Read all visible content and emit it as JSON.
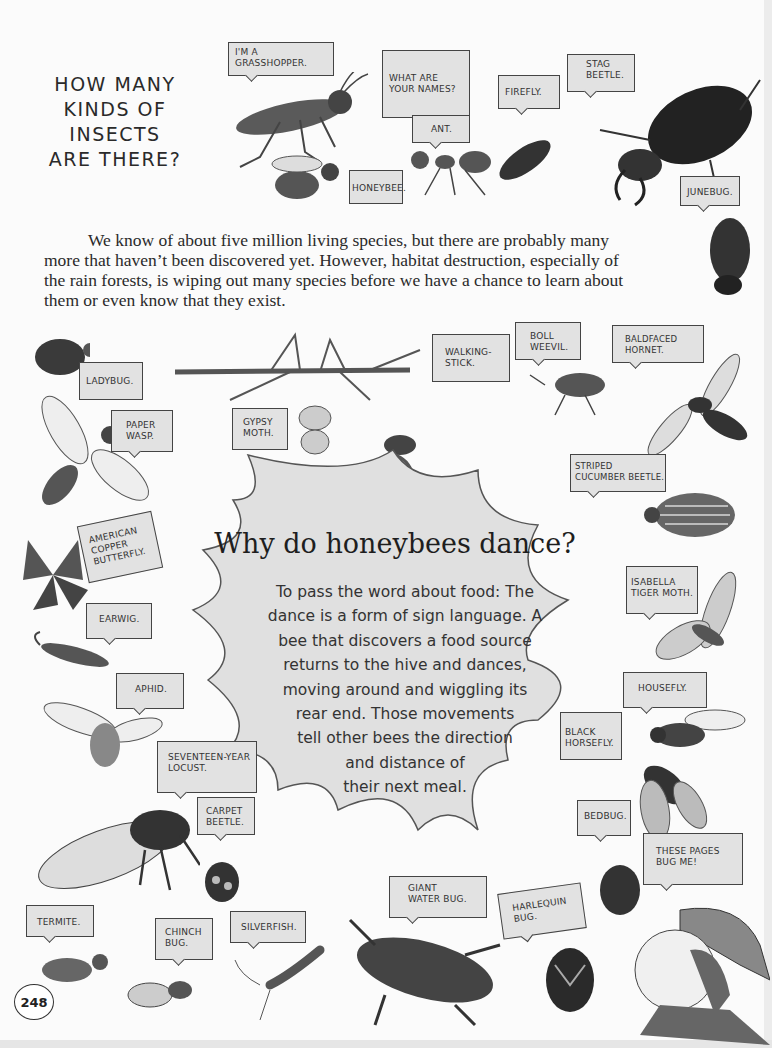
{
  "heading": {
    "lines": [
      "HOW MANY",
      "KINDS OF",
      "INSECTS",
      "ARE THERE?"
    ]
  },
  "intro": {
    "text": "We know of about five million living species, but there are probably many more that haven’t been discovered yet. However, habitat destruction, especially of the rain forests, is wiping out many species before we have a chance to learn about them or even know that they exist."
  },
  "feature": {
    "title": "Why do honeybees dance?",
    "body_lines": [
      "To pass the word about food: The",
      "dance is a form of sign language. A",
      "bee that discovers a food source",
      "returns to the hive and dances,",
      "moving around and wiggling its",
      "rear end. Those movements",
      "tell other bees the direction",
      "and distance of",
      "their next meal."
    ]
  },
  "speech_bubbles": {
    "grasshopper": "I'M A\nGRASSHOPPER.",
    "question": "WHAT ARE\nYOUR NAMES?",
    "ant": "ANT.",
    "firefly": "FIREFLY.",
    "stag_beetle": "STAG\nBEETLE.",
    "honeybee": "HONEYBEE.",
    "junebug": "JUNEBUG.",
    "ladybug": "LADYBUG.",
    "paper_wasp": "PAPER\nWASP.",
    "walking_stick": "WALKING-\nSTICK.",
    "gypsy_moth": "GYPSY\nMOTH.",
    "boll_weevil": "BOLL\nWEEVIL.",
    "baldfaced_hornet": "BALDFACED\nHORNET.",
    "striped_cucumber_beetle": "STRIPED\nCUCUMBER BEETLE.",
    "american_copper_butterfly": "AMERICAN\nCOPPER\nBUTTERFLY.",
    "earwig": "EARWIG.",
    "isabella_tiger_moth": "ISABELLA\nTIGER MOTH.",
    "aphid": "APHID.",
    "housefly": "HOUSEFLY.",
    "black_horsefly": "BLACK\nHORSEFLY.",
    "seventeen_year_locust": "SEVENTEEN-YEAR\nLOCUST.",
    "carpet_beetle": "CARPET\nBEETLE.",
    "bedbug": "BEDBUG.",
    "these_pages": "THESE PAGES\nBUG ME!",
    "giant_water_bug": "GIANT\nWATER BUG.",
    "harlequin_bug": "HARLEQUIN\nBUG.",
    "termite": "TERMITE.",
    "chinch_bug": "CHINCH\nBUG.",
    "silverfish": "SILVERFISH."
  },
  "page_number": "248"
}
